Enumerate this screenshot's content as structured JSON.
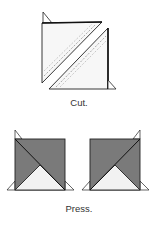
{
  "steps": [
    {
      "id": "cut",
      "caption": "Cut."
    },
    {
      "id": "press",
      "caption": "Press."
    }
  ],
  "colors": {
    "fabric_dark": "#7a7a7a",
    "fabric_light": "#f3f3f3",
    "outline": "#222222",
    "seam_dash": "#888888"
  }
}
